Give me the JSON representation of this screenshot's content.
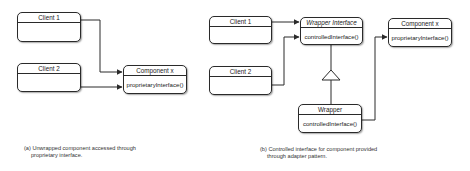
{
  "panel_a": {
    "client1": {
      "title": "Client 1",
      "body": ""
    },
    "client2": {
      "title": "Client 2",
      "body": ""
    },
    "component": {
      "title": "Component x",
      "method": "proprietaryInterface()"
    },
    "caption": {
      "line1": "(a) Unwrapped component accessed through",
      "line2": "proprietary interface."
    }
  },
  "panel_b": {
    "client1": {
      "title": "Client 1",
      "body": ""
    },
    "client2": {
      "title": "Client 2",
      "body": ""
    },
    "wrapper_interface": {
      "title": "Wrapper Interface",
      "method": "controlledInterface()"
    },
    "component": {
      "title": "Component x",
      "method": "proprietaryInterface()"
    },
    "wrapper": {
      "title": "Wrapper",
      "method": "controlledInterface()"
    },
    "caption": {
      "line1": "(b) Controlled interface for component provided",
      "line2": "through adapter pattern."
    }
  },
  "colors": {
    "line": "#2a2a2a",
    "box_fill": "#ffffff",
    "background": "#ffffff"
  }
}
